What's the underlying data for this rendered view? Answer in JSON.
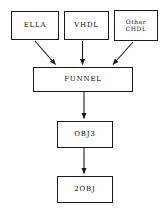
{
  "diagram": {
    "background_color": "#ffffff",
    "line_color": "#1a1a1a",
    "text_color": "#111111",
    "nodes": [
      {
        "id": "ella",
        "label": "ELLA"
      },
      {
        "id": "vhdl",
        "label": "VHDL"
      },
      {
        "id": "chdl",
        "label": "Other\nCHDL"
      },
      {
        "id": "funnel",
        "label": "FUNNEL"
      },
      {
        "id": "obj3",
        "label": "OBJ3"
      },
      {
        "id": "obj2",
        "label": "2OBJ"
      }
    ],
    "edges": [
      {
        "from": "ella",
        "to": "funnel",
        "style": "diagonal-right-down"
      },
      {
        "from": "vhdl",
        "to": "funnel",
        "style": "vertical"
      },
      {
        "from": "chdl",
        "to": "funnel",
        "style": "diagonal-left-down"
      },
      {
        "from": "funnel",
        "to": "obj3",
        "style": "vertical"
      },
      {
        "from": "obj3",
        "to": "obj2",
        "style": "vertical"
      }
    ]
  }
}
